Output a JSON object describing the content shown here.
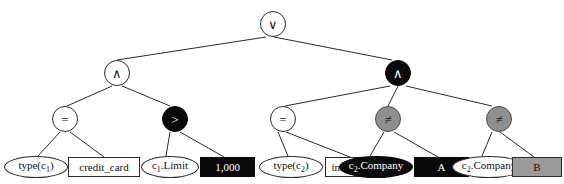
{
  "diagram": {
    "type": "boolean-expression-tree",
    "colors": {
      "white": "#ffffff",
      "black": "#0a0a0a",
      "gray": "#8f8f8f",
      "gray_rect": "#9a9a9a",
      "stroke": "#2b2b2b"
    },
    "nodes": [
      {
        "id": "root",
        "label": "∨",
        "shape": "circle",
        "fill": "white",
        "x": 260,
        "y": 11,
        "w": 26,
        "h": 26
      },
      {
        "id": "and-left",
        "label": "∧",
        "shape": "circle",
        "fill": "white",
        "x": 104,
        "y": 60,
        "w": 26,
        "h": 26
      },
      {
        "id": "and-right",
        "label": "∧",
        "shape": "circle",
        "fill": "black",
        "x": 385,
        "y": 60,
        "w": 26,
        "h": 26
      },
      {
        "id": "eq-1",
        "label": "=",
        "shape": "circle",
        "fill": "white",
        "x": 52,
        "y": 106,
        "w": 26,
        "h": 26
      },
      {
        "id": "gt-1",
        "label": ">",
        "shape": "circle",
        "fill": "black",
        "x": 162,
        "y": 106,
        "w": 26,
        "h": 26
      },
      {
        "id": "eq-2",
        "label": "=",
        "shape": "circle",
        "fill": "white",
        "x": 270,
        "y": 106,
        "w": 26,
        "h": 26
      },
      {
        "id": "neq-1",
        "label": "≠",
        "shape": "circle",
        "fill": "gray",
        "x": 375,
        "y": 106,
        "w": 26,
        "h": 26
      },
      {
        "id": "neq-2",
        "label": "≠",
        "shape": "circle",
        "fill": "gray",
        "x": 486,
        "y": 106,
        "w": 26,
        "h": 26
      }
    ],
    "leaves": [
      {
        "id": "type-c1",
        "base": "type(c",
        "subscript": "1",
        "tail": ")",
        "shape": "ellipse",
        "fill": "white",
        "x": 4,
        "y": 156,
        "w": 64,
        "h": 22
      },
      {
        "id": "credit-card",
        "base": "credit_card",
        "subscript": "",
        "tail": "",
        "shape": "rect",
        "fill": "white",
        "x": 68,
        "y": 157,
        "w": 72,
        "h": 20
      },
      {
        "id": "c1-limit",
        "base": "c",
        "subscript": "1",
        "tail": ".Limit",
        "shape": "ellipse",
        "fill": "white",
        "x": 141,
        "y": 156,
        "w": 58,
        "h": 22
      },
      {
        "id": "value-1000",
        "base": "1,000",
        "subscript": "",
        "tail": "",
        "shape": "rect",
        "fill": "black",
        "x": 200,
        "y": 157,
        "w": 55,
        "h": 20
      },
      {
        "id": "type-c2",
        "base": "type(c",
        "subscript": "2",
        "tail": ")",
        "shape": "ellipse",
        "fill": "white",
        "x": 259,
        "y": 156,
        "w": 64,
        "h": 22
      },
      {
        "id": "insurance",
        "base": "insurance",
        "subscript": "",
        "tail": "",
        "shape": "rect",
        "fill": "white",
        "x": 325,
        "y": 157,
        "w": 55,
        "h": 20
      },
      {
        "id": "c2-company-a",
        "base": "c",
        "subscript": "2",
        "tail": ".Company",
        "shape": "ellipse",
        "fill": "black",
        "x": 339,
        "y": 156,
        "w": 74,
        "h": 22
      },
      {
        "id": "value-a",
        "base": "A",
        "subscript": "",
        "tail": "",
        "shape": "rect",
        "fill": "black",
        "x": 414,
        "y": 157,
        "w": 55,
        "h": 20
      },
      {
        "id": "c2-company-b",
        "base": "c",
        "subscript": "2",
        "tail": ".Company",
        "shape": "ellipse",
        "fill": "white",
        "x": 452,
        "y": 156,
        "w": 74,
        "h": 22
      },
      {
        "id": "value-b",
        "base": "B",
        "subscript": "",
        "tail": "",
        "shape": "rect",
        "fill": "gray",
        "x": 512,
        "y": 157,
        "w": 50,
        "h": 20
      }
    ],
    "edges": [
      {
        "from": "root",
        "to": "and-left",
        "x1": 266,
        "y1": 37,
        "x2": 117,
        "y2": 60
      },
      {
        "from": "root",
        "to": "and-right",
        "x1": 274,
        "y1": 37,
        "x2": 392,
        "y2": 60
      },
      {
        "from": "and-left",
        "to": "eq-1",
        "x1": 112,
        "y1": 86,
        "x2": 67,
        "y2": 106
      },
      {
        "from": "and-left",
        "to": "gt-1",
        "x1": 122,
        "y1": 86,
        "x2": 170,
        "y2": 106
      },
      {
        "from": "and-right",
        "to": "eq-2",
        "x1": 390,
        "y1": 86,
        "x2": 285,
        "y2": 106
      },
      {
        "from": "and-right",
        "to": "neq-1",
        "x1": 398,
        "y1": 86,
        "x2": 388,
        "y2": 106
      },
      {
        "from": "and-right",
        "to": "neq-2",
        "x1": 406,
        "y1": 86,
        "x2": 492,
        "y2": 106
      },
      {
        "from": "eq-1",
        "to": "type-c1",
        "x1": 60,
        "y1": 132,
        "x2": 38,
        "y2": 156
      },
      {
        "from": "eq-1",
        "to": "credit-card",
        "x1": 70,
        "y1": 132,
        "x2": 104,
        "y2": 157
      },
      {
        "from": "gt-1",
        "to": "c1-limit",
        "x1": 170,
        "y1": 132,
        "x2": 166,
        "y2": 156
      },
      {
        "from": "gt-1",
        "to": "value-1000",
        "x1": 180,
        "y1": 132,
        "x2": 224,
        "y2": 157
      },
      {
        "from": "eq-2",
        "to": "type-c2",
        "x1": 278,
        "y1": 132,
        "x2": 288,
        "y2": 156
      },
      {
        "from": "eq-2",
        "to": "insurance",
        "x1": 286,
        "y1": 132,
        "x2": 350,
        "y2": 157
      },
      {
        "from": "neq-1",
        "to": "c2-company-a",
        "x1": 384,
        "y1": 132,
        "x2": 370,
        "y2": 156
      },
      {
        "from": "neq-1",
        "to": "value-a",
        "x1": 394,
        "y1": 132,
        "x2": 438,
        "y2": 157
      },
      {
        "from": "neq-2",
        "to": "c2-company-b",
        "x1": 492,
        "y1": 132,
        "x2": 482,
        "y2": 156
      },
      {
        "from": "neq-2",
        "to": "value-b",
        "x1": 500,
        "y1": 132,
        "x2": 534,
        "y2": 157
      }
    ]
  }
}
